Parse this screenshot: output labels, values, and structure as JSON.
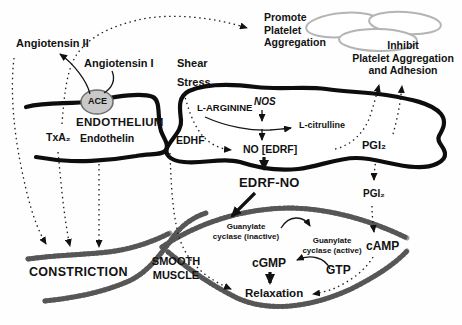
{
  "diagram": {
    "colors": {
      "membrane": "#0d0d0d",
      "smooth_muscle": "#9c9c9c",
      "smooth_muscle_hatch": "#565656",
      "platelet_outline": "#b4b4b4",
      "ace_fill": "#c9c9c9",
      "text": "#121212"
    },
    "labels": {
      "angiotensin2": "Angiotensin II",
      "angiotensin1": "Angiotensin I",
      "shear_stress": "Shear\nStress",
      "ace": "ACE",
      "endothelium": "ENDOTHELIUM",
      "txa2": "TxA₂",
      "endothelin": "Endothelin",
      "edhf": "EDHF",
      "l_arginine": "L-ARGININE",
      "nos": "NOS",
      "l_citrulline": "L-citrulline",
      "no_edrf": "NO [EDRF]",
      "pgi2_cell": "PGI₂",
      "pgi2_mid": "PGI₂",
      "edrf_no": "EDRF-NO",
      "promote_platelet": "Promote\nPlatelet\nAggregation",
      "inhibit_platelet": "Inhibit\nPlatelet Aggregation\nand Adhesion",
      "gc_inactive": "Guanylate\ncyclase (inactive)",
      "gc_active": "Guanylate\ncyclase (active)",
      "cgmp": "cGMP",
      "gtp": "GTP",
      "relaxation": "Relaxation",
      "camp": "cAMP",
      "constriction": "CONSTRICTION",
      "smooth_muscle": "SMOOTH\nMUSCLE"
    }
  }
}
